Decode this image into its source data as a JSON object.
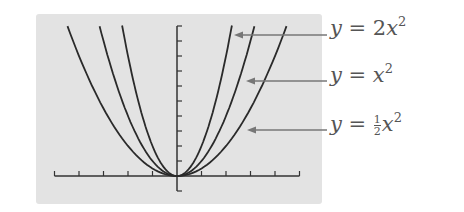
{
  "chart_data": {
    "type": "line",
    "title": "",
    "xlabel": "",
    "ylabel": "",
    "xlim": [
      -5,
      5
    ],
    "ylim": [
      -1,
      10
    ],
    "x_tick_step": 1,
    "y_tick_step": 1,
    "tick_labels_shown": false,
    "grid": false,
    "legend": "annotations with arrows to the right of the plot",
    "series": [
      {
        "name": "y = 2x^2",
        "label_parts": {
          "lhs": "y",
          "eq": "=",
          "coef": "2",
          "var": "x",
          "exp": "2"
        },
        "a": 2,
        "x_range": [
          -2.24,
          2.24
        ]
      },
      {
        "name": "y = x^2",
        "label_parts": {
          "lhs": "y",
          "eq": "=",
          "coef": "",
          "var": "x",
          "exp": "2"
        },
        "a": 1,
        "x_range": [
          -3.16,
          3.16
        ]
      },
      {
        "name": "y = 1/2 x^2",
        "label_parts": {
          "lhs": "y",
          "eq": "=",
          "coef_num": "1",
          "coef_den": "2",
          "var": "x",
          "exp": "2"
        },
        "a": 0.5,
        "x_range": [
          -4.47,
          4.47
        ]
      }
    ]
  },
  "colors": {
    "panel_bg": "#e3e3e3",
    "curve": "#2a2a2a",
    "axis": "#333333",
    "label": "#555555",
    "arrow": "#777777"
  }
}
